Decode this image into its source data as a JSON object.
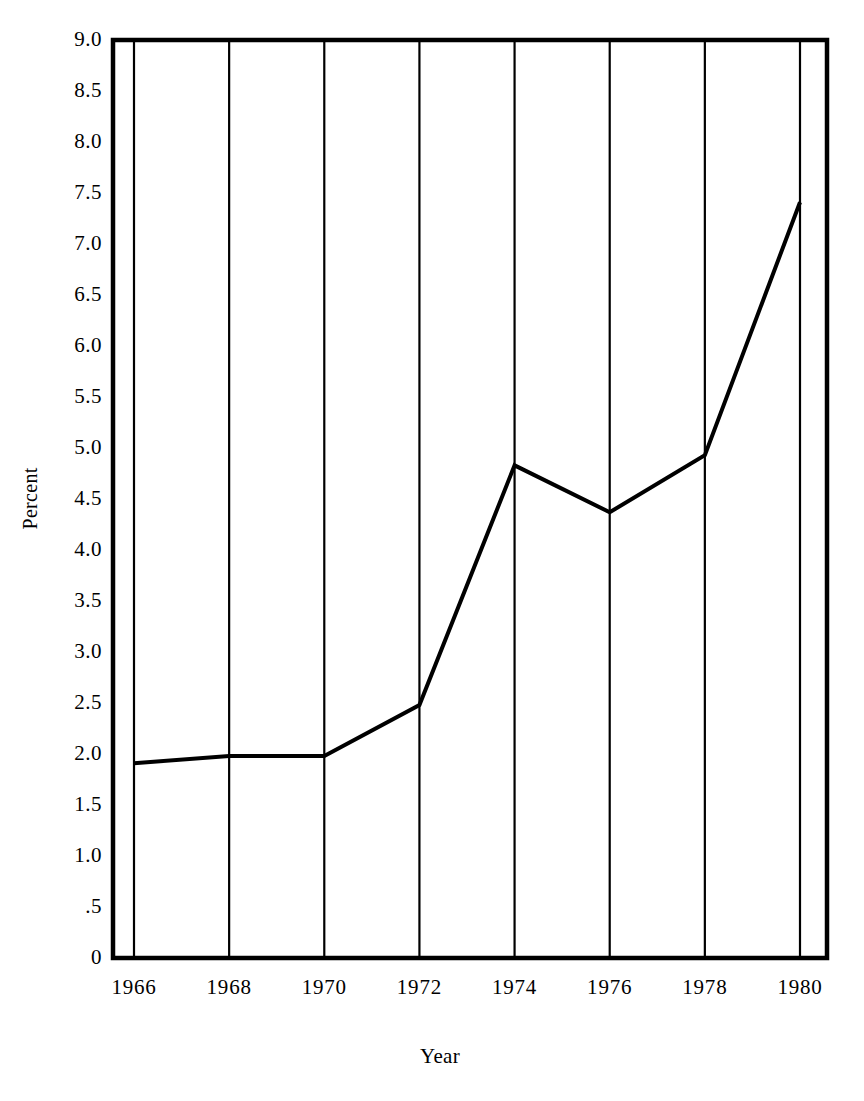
{
  "chart_data": {
    "type": "line",
    "title": "",
    "subtitle": "",
    "xlabel": "Year",
    "ylabel": "Percent",
    "x": [
      1966,
      1968,
      1970,
      1972,
      1974,
      1976,
      1978,
      1980
    ],
    "categories": [
      "1966",
      "1968",
      "1970",
      "1972",
      "1974",
      "1976",
      "1978",
      "1980"
    ],
    "values": [
      1.91,
      1.98,
      1.98,
      2.48,
      4.83,
      4.37,
      4.93,
      7.41
    ],
    "series": [
      {
        "name": "Percent",
        "values": [
          1.91,
          1.98,
          1.98,
          2.48,
          4.83,
          4.37,
          4.93,
          7.41
        ]
      }
    ],
    "xlim": [
      1966,
      1980
    ],
    "ylim": [
      0,
      9.0
    ],
    "ytick_values": [
      0,
      0.5,
      1.0,
      1.5,
      2.0,
      2.5,
      3.0,
      3.5,
      4.0,
      4.5,
      5.0,
      5.5,
      6.0,
      6.5,
      7.0,
      7.5,
      8.0,
      8.5,
      9.0
    ],
    "ytick_labels": [
      "0",
      ".5",
      "1.0",
      "1.5",
      "2.0",
      "2.5",
      "3.0",
      "3.5",
      "4.0",
      "4.5",
      "5.0",
      "5.5",
      "6.0",
      "6.5",
      "7.0",
      "7.5",
      "8.0",
      "8.5",
      "9.0"
    ],
    "xtick_values": [
      1966,
      1968,
      1970,
      1972,
      1974,
      1976,
      1978,
      1980
    ],
    "xtick_labels": [
      "1966",
      "1968",
      "1970",
      "1972",
      "1974",
      "1976",
      "1978",
      "1980"
    ],
    "grid": {
      "vertical": true,
      "horizontal": false
    },
    "legend": {
      "visible": false,
      "position": "none",
      "entries": []
    },
    "colors": {
      "line": "#000000",
      "axis": "#000000",
      "grid": "#000000",
      "background": "#ffffff",
      "text": "#000000"
    },
    "line_width_px": 4,
    "markers": "none",
    "frame": "box"
  }
}
